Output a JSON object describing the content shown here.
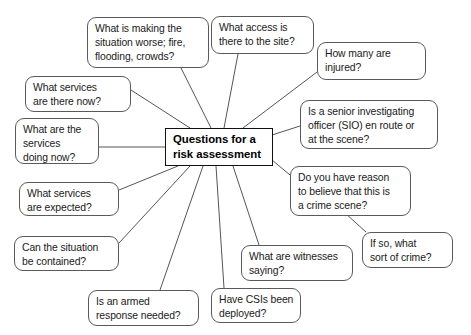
{
  "diagram": {
    "type": "mind-map",
    "center": {
      "id": "center",
      "lines": [
        "Questions for a",
        "risk assessment"
      ],
      "x": 165,
      "y": 128,
      "w": 108,
      "h": 38
    },
    "nodes": [
      {
        "id": "situation-worse",
        "lines": [
          "What is making the",
          "situation worse; fire,",
          "flooding, crowds?"
        ],
        "x": 87,
        "y": 17,
        "w": 122,
        "h": 51,
        "anchor": {
          "x": 181,
          "y": 68
        }
      },
      {
        "id": "site-access",
        "lines": [
          "What access is",
          "there to the site?"
        ],
        "x": 211,
        "y": 16,
        "w": 103,
        "h": 38,
        "anchor": {
          "x": 238,
          "y": 54
        }
      },
      {
        "id": "how-many-injured",
        "lines": [
          "How many are",
          "injured?"
        ],
        "x": 317,
        "y": 42,
        "w": 109,
        "h": 38,
        "anchor": {
          "x": 317,
          "y": 72
        }
      },
      {
        "id": "senior-investigating-officer",
        "lines": [
          "Is a senior investigating",
          "officer (SIO) en route or",
          "at the scene?"
        ],
        "x": 300,
        "y": 100,
        "w": 138,
        "h": 49,
        "anchor": {
          "x": 300,
          "y": 126
        }
      },
      {
        "id": "crime-scene-reason",
        "lines": [
          "Do you have reason",
          "to believe that this is",
          "a crime scene?"
        ],
        "x": 290,
        "y": 166,
        "w": 121,
        "h": 50,
        "anchor": {
          "x": 290,
          "y": 175
        }
      },
      {
        "id": "sort-of-crime",
        "lines": [
          "If so, what",
          "sort of crime?"
        ],
        "x": 362,
        "y": 232,
        "w": 91,
        "h": 36,
        "anchor": {
          "x": 366,
          "y": 232
        }
      },
      {
        "id": "witnesses-saying",
        "lines": [
          "What are witnesses",
          "saying?"
        ],
        "x": 241,
        "y": 245,
        "w": 112,
        "h": 36,
        "anchor": {
          "x": 259,
          "y": 245
        }
      },
      {
        "id": "csis-deployed",
        "lines": [
          "Have CSIs been",
          "deployed?"
        ],
        "x": 211,
        "y": 288,
        "w": 90,
        "h": 35,
        "anchor": {
          "x": 224,
          "y": 288
        }
      },
      {
        "id": "armed-response",
        "lines": [
          "Is an armed",
          "response needed?"
        ],
        "x": 88,
        "y": 290,
        "w": 111,
        "h": 36,
        "anchor": {
          "x": 160,
          "y": 290
        }
      },
      {
        "id": "situation-contained",
        "lines": [
          "Can the situation",
          "be contained?"
        ],
        "x": 14,
        "y": 236,
        "w": 105,
        "h": 35,
        "anchor": {
          "x": 119,
          "y": 243
        }
      },
      {
        "id": "services-expected",
        "lines": [
          "What services",
          "are expected?"
        ],
        "x": 19,
        "y": 182,
        "w": 100,
        "h": 34,
        "anchor": {
          "x": 119,
          "y": 190
        }
      },
      {
        "id": "services-doing-now",
        "lines": [
          "What are the",
          "services",
          "doing now?"
        ],
        "x": 15,
        "y": 118,
        "w": 84,
        "h": 46,
        "anchor": {
          "x": 99,
          "y": 147
        }
      },
      {
        "id": "services-there-now",
        "lines": [
          "What services",
          "are there now?"
        ],
        "x": 25,
        "y": 76,
        "w": 106,
        "h": 36,
        "anchor": {
          "x": 131,
          "y": 90
        }
      }
    ],
    "edges": [
      {
        "id": "edge-situation-worse",
        "x1": 181,
        "y1": 68,
        "x2": 211,
        "y2": 128
      },
      {
        "id": "edge-site-access",
        "x1": 238,
        "y1": 54,
        "x2": 224,
        "y2": 128
      },
      {
        "id": "edge-how-many-injured",
        "x1": 317,
        "y1": 72,
        "x2": 243,
        "y2": 128
      },
      {
        "id": "edge-sio",
        "x1": 300,
        "y1": 126,
        "x2": 272,
        "y2": 135
      },
      {
        "id": "edge-crime-scene",
        "x1": 290,
        "y1": 175,
        "x2": 272,
        "y2": 160
      },
      {
        "id": "edge-sort-of-crime",
        "x1": 366,
        "y1": 232,
        "x2": 345,
        "y2": 213
      },
      {
        "id": "edge-witnesses",
        "x1": 259,
        "y1": 245,
        "x2": 233,
        "y2": 166
      },
      {
        "id": "edge-csis",
        "x1": 224,
        "y1": 288,
        "x2": 216,
        "y2": 166
      },
      {
        "id": "edge-armed-response",
        "x1": 160,
        "y1": 290,
        "x2": 203,
        "y2": 166
      },
      {
        "id": "edge-contained",
        "x1": 119,
        "y1": 243,
        "x2": 190,
        "y2": 166
      },
      {
        "id": "edge-services-expected",
        "x1": 119,
        "y1": 190,
        "x2": 178,
        "y2": 166
      },
      {
        "id": "edge-services-doing",
        "x1": 99,
        "y1": 147,
        "x2": 165,
        "y2": 147
      },
      {
        "id": "edge-services-there",
        "x1": 131,
        "y1": 90,
        "x2": 190,
        "y2": 128
      }
    ],
    "style": {
      "node_border": "#5a5a5a",
      "center_border": "#111111",
      "edge_color": "#555555",
      "background": "#ffffff",
      "text_color": "#1a1a1a"
    }
  }
}
